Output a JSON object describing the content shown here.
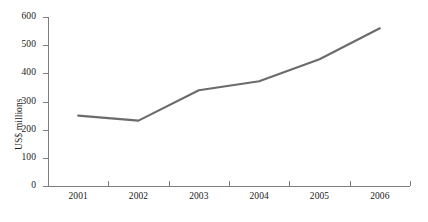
{
  "chart_data": {
    "type": "line",
    "title": "",
    "subtitle": "",
    "xlabel": "",
    "ylabel": "US$ millions",
    "categories": [
      "2001",
      "2002",
      "2003",
      "2004",
      "2005",
      "2006"
    ],
    "x": [
      2001,
      2002,
      2003,
      2004,
      2005,
      2006
    ],
    "series": [
      {
        "name": "",
        "values": [
          250,
          232,
          340,
          372,
          450,
          560
        ],
        "color": "#6b6b6b"
      }
    ],
    "ylim": [
      0,
      600
    ],
    "yticks": [
      0,
      100,
      200,
      300,
      400,
      500,
      600
    ],
    "ytick_labels": [
      "0",
      "100",
      "200",
      "300",
      "400",
      "500",
      "600"
    ],
    "xtick_labels": [
      "2001",
      "2002",
      "2003",
      "2004",
      "2005",
      "2006"
    ],
    "grid": false,
    "legend": false,
    "legend_position": "none",
    "axis_color": "#7d7d7d",
    "background": "#ffffff"
  },
  "axes": {
    "y_title": "US$ millions"
  }
}
